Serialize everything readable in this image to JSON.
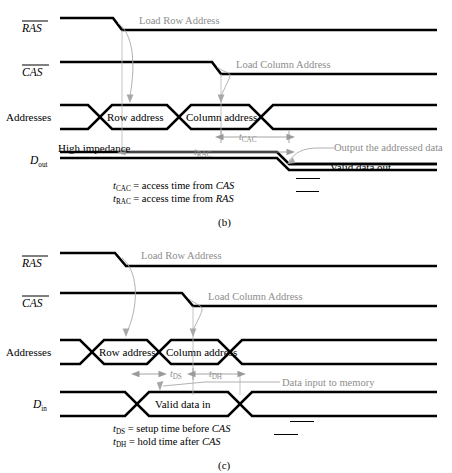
{
  "figure": {
    "panels": [
      {
        "id": "b",
        "panel_label": "(b)",
        "signals": [
          {
            "name": "RAS",
            "label": "RAS",
            "overline": true,
            "type": "active-low-strobe"
          },
          {
            "name": "CAS",
            "label": "CAS",
            "overline": true,
            "type": "active-low-strobe"
          },
          {
            "name": "Addresses",
            "label": "Addresses",
            "overline": false,
            "type": "bus"
          },
          {
            "name": "Dout",
            "label": "D",
            "sub": "out",
            "overline": false,
            "type": "bus"
          }
        ],
        "bus_values": [
          {
            "signal": "Addresses",
            "text": "Row address"
          },
          {
            "signal": "Addresses",
            "text": "Column address"
          },
          {
            "signal": "Dout",
            "text": "Valid data out"
          }
        ],
        "annotations": [
          {
            "text": "Load Row Address",
            "color": "#8d8d8d",
            "target": "RAS falling edge to Addresses row value"
          },
          {
            "text": "Load Column Address",
            "color": "#8d8d8d",
            "target": "CAS falling edge to Addresses column value"
          },
          {
            "text": "Output the addressed data",
            "color": "#8d8d8d",
            "target": "Dout valid data transition"
          },
          {
            "text": "High impedance",
            "color": "#000000",
            "target": "Dout before valid data"
          }
        ],
        "timing_params": [
          {
            "symbol": "t",
            "sub": "CAC",
            "measured_from": "CAS falling edge",
            "measured_to": "Dout valid"
          },
          {
            "symbol": "t",
            "sub": "RAC",
            "measured_from": "RAS falling edge",
            "measured_to": "Dout valid"
          }
        ],
        "caption_lines": [
          {
            "symbol": "t",
            "sub": "CAC",
            "text": " = access time from ",
            "ref": "CAS",
            "ref_overline": true
          },
          {
            "symbol": "t",
            "sub": "RAC",
            "text": " = access time from ",
            "ref": "RAS",
            "ref_overline": true
          }
        ]
      },
      {
        "id": "c",
        "panel_label": "(c)",
        "signals": [
          {
            "name": "RAS",
            "label": "RAS",
            "overline": true,
            "type": "active-low-strobe"
          },
          {
            "name": "CAS",
            "label": "CAS",
            "overline": true,
            "type": "active-low-strobe"
          },
          {
            "name": "Addresses",
            "label": "Addresses",
            "overline": false,
            "type": "bus"
          },
          {
            "name": "Din",
            "label": "D",
            "sub": "in",
            "overline": false,
            "type": "bus"
          }
        ],
        "bus_values": [
          {
            "signal": "Addresses",
            "text": "Row address"
          },
          {
            "signal": "Addresses",
            "text": "Column address"
          },
          {
            "signal": "Din",
            "text": "Valid data in"
          }
        ],
        "annotations": [
          {
            "text": "Load Row Address",
            "color": "#8d8d8d",
            "target": "RAS falling edge to Addresses row value"
          },
          {
            "text": "Load Column Address",
            "color": "#8d8d8d",
            "target": "CAS falling edge to Addresses column value"
          },
          {
            "text": "Data input to memory",
            "color": "#8d8d8d",
            "target": "Din valid data in"
          }
        ],
        "timing_params": [
          {
            "symbol": "t",
            "sub": "DS",
            "measured_from": "Din valid start",
            "measured_to": "CAS falling edge"
          },
          {
            "symbol": "t",
            "sub": "DH",
            "measured_from": "CAS falling edge",
            "measured_to": "Din valid end"
          }
        ],
        "caption_lines": [
          {
            "symbol": "t",
            "sub": "DS",
            "text": " = setup time before ",
            "ref": "CAS",
            "ref_overline": true
          },
          {
            "symbol": "t",
            "sub": "DH",
            "text": " = hold time after ",
            "ref": "CAS",
            "ref_overline": true
          }
        ]
      }
    ]
  },
  "text": {
    "ras": "RAS",
    "cas": "CAS",
    "addresses": "Addresses",
    "d_letter": "D",
    "out_sub": "out",
    "in_sub": "in",
    "row_address": "Row address",
    "column_address": "Column address",
    "valid_data_out": "Valid data out",
    "valid_data_in": "Valid data in",
    "high_impedance": "High impedance",
    "load_row_address": "Load Row Address",
    "load_column_address": "Load Column Address",
    "output_addressed_data": "Output the addressed data",
    "data_input_to_memory": "Data input to memory",
    "t": "t",
    "cac": "CAC",
    "rac": "RAC",
    "ds": "DS",
    "dh": "DH",
    "cap_b1_eq": " = access time from ",
    "cap_b2_eq": " = access time from ",
    "cap_c1_eq": " = setup time before ",
    "cap_c2_eq": " = hold time after ",
    "panel_b": "(b)",
    "panel_c": "(c)"
  },
  "colors": {
    "signal": "#000000",
    "annotation_gray": "#8d8d8d",
    "dimension_gray": "#9a9a9a",
    "reference_gray": "#b5b5b5",
    "background": "#ffffff"
  }
}
